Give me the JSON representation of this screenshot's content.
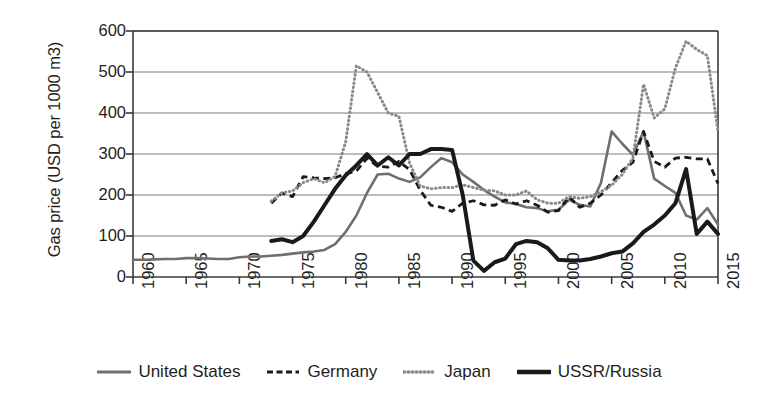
{
  "chart_data": {
    "type": "line",
    "title": "",
    "xlabel": "",
    "ylabel": "Gas price (USD per 1000 m3)",
    "xlim": [
      1960,
      2015
    ],
    "ylim": [
      0,
      600
    ],
    "grid": "horizontal",
    "legend_position": "bottom",
    "y_ticks": [
      600,
      500,
      400,
      300,
      200,
      100,
      0
    ],
    "x_ticks": [
      1960,
      1965,
      1970,
      1975,
      1980,
      1985,
      1990,
      1995,
      2000,
      2005,
      2010,
      2015
    ],
    "series": [
      {
        "name": "United States",
        "style": "solid",
        "color": "#6f6f6f",
        "width": 2.6,
        "x": [
          1960,
          1961,
          1962,
          1963,
          1964,
          1965,
          1966,
          1967,
          1968,
          1969,
          1970,
          1971,
          1972,
          1973,
          1974,
          1975,
          1976,
          1977,
          1978,
          1979,
          1980,
          1981,
          1982,
          1983,
          1984,
          1985,
          1986,
          1987,
          1988,
          1989,
          1990,
          1991,
          1992,
          1993,
          1994,
          1995,
          1996,
          1997,
          1998,
          1999,
          2000,
          2001,
          2002,
          2003,
          2004,
          2005,
          2006,
          2007,
          2008,
          2009,
          2010,
          2011,
          2012,
          2013,
          2014,
          2015
        ],
        "values": [
          42,
          42,
          43,
          44,
          44,
          46,
          46,
          45,
          44,
          44,
          48,
          50,
          50,
          52,
          54,
          57,
          60,
          62,
          66,
          80,
          110,
          150,
          205,
          250,
          252,
          240,
          232,
          243,
          268,
          290,
          280,
          250,
          232,
          212,
          196,
          182,
          178,
          170,
          168,
          160,
          164,
          188,
          176,
          172,
          230,
          355,
          325,
          298,
          355,
          240,
          222,
          205,
          150,
          140,
          168,
          128
        ]
      },
      {
        "name": "Germany",
        "style": "dashed",
        "color": "#1a1a1a",
        "width": 2.8,
        "x": [
          1973,
          1974,
          1975,
          1976,
          1977,
          1978,
          1979,
          1980,
          1981,
          1982,
          1983,
          1984,
          1985,
          1986,
          1987,
          1988,
          1989,
          1990,
          1991,
          1992,
          1993,
          1994,
          1995,
          1996,
          1997,
          1998,
          1999,
          2000,
          2001,
          2002,
          2003,
          2004,
          2005,
          2006,
          2007,
          2008,
          2009,
          2010,
          2011,
          2012,
          2013,
          2014,
          2015
        ],
        "values": [
          180,
          205,
          196,
          245,
          242,
          240,
          242,
          252,
          258,
          290,
          270,
          268,
          282,
          262,
          212,
          175,
          170,
          160,
          180,
          186,
          176,
          175,
          188,
          178,
          186,
          175,
          158,
          162,
          196,
          170,
          180,
          200,
          230,
          260,
          280,
          355,
          282,
          268,
          290,
          292,
          288,
          288,
          228
        ]
      },
      {
        "name": "Japan",
        "style": "dotted",
        "color": "#8a8a8a",
        "width": 3.0,
        "x": [
          1973,
          1974,
          1975,
          1976,
          1977,
          1978,
          1979,
          1980,
          1981,
          1982,
          1983,
          1984,
          1985,
          1986,
          1987,
          1988,
          1989,
          1990,
          1991,
          1992,
          1993,
          1994,
          1995,
          1996,
          1997,
          1998,
          1999,
          2000,
          2001,
          2002,
          2003,
          2004,
          2005,
          2006,
          2007,
          2008,
          2009,
          2010,
          2011,
          2012,
          2013,
          2014,
          2015
        ],
        "values": [
          185,
          205,
          210,
          230,
          240,
          230,
          245,
          330,
          515,
          500,
          450,
          400,
          392,
          278,
          222,
          215,
          218,
          218,
          225,
          218,
          212,
          210,
          200,
          200,
          210,
          188,
          180,
          180,
          196,
          192,
          196,
          208,
          224,
          250,
          290,
          470,
          388,
          410,
          510,
          575,
          555,
          540,
          355
        ]
      },
      {
        "name": "USSR/Russia",
        "style": "solid",
        "color": "#1a1a1a",
        "width": 4.0,
        "x": [
          1973,
          1974,
          1975,
          1976,
          1977,
          1978,
          1979,
          1980,
          1981,
          1982,
          1983,
          1984,
          1985,
          1986,
          1987,
          1988,
          1989,
          1990,
          1991,
          1992,
          1993,
          1994,
          1995,
          1996,
          1997,
          1998,
          1999,
          2000,
          2001,
          2002,
          2003,
          2004,
          2005,
          2006,
          2007,
          2008,
          2009,
          2010,
          2011,
          2012,
          2013,
          2014,
          2015
        ],
        "values": [
          88,
          92,
          85,
          100,
          135,
          175,
          215,
          248,
          272,
          300,
          272,
          292,
          272,
          300,
          300,
          312,
          312,
          310,
          200,
          40,
          15,
          36,
          45,
          80,
          88,
          85,
          70,
          42,
          40,
          40,
          44,
          50,
          58,
          62,
          82,
          110,
          128,
          150,
          180,
          263,
          105,
          135,
          105
        ]
      }
    ]
  },
  "legend": {
    "items": [
      {
        "label": "United States",
        "swatch": "line-solid-gray-icon"
      },
      {
        "label": "Germany",
        "swatch": "line-dashed-black-icon"
      },
      {
        "label": "Japan",
        "swatch": "line-dotted-gray-icon"
      },
      {
        "label": "USSR/Russia",
        "swatch": "line-solid-black-icon"
      }
    ]
  }
}
